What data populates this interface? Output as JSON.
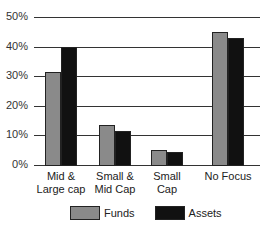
{
  "chart_data": {
    "type": "bar",
    "title": "",
    "xlabel": "",
    "ylabel": "",
    "ylim": [
      0,
      50
    ],
    "yticks": [
      "0%",
      "10%",
      "20%",
      "30%",
      "40%",
      "50%"
    ],
    "categories": [
      "Mid & Large cap",
      "Small & Mid Cap",
      "Small Cap",
      "No Focus"
    ],
    "series": [
      {
        "name": "Funds",
        "color": "#8a8a8a",
        "values": [
          31.5,
          13.5,
          5,
          45
        ]
      },
      {
        "name": "Assets",
        "color": "#111111",
        "values": [
          40,
          11.5,
          4.3,
          43
        ]
      }
    ],
    "grid": true,
    "legend_position": "bottom"
  },
  "labels": {
    "yticks": [
      "0%",
      "10%",
      "20%",
      "30%",
      "40%",
      "50%"
    ],
    "cats": [
      [
        "Mid &",
        "Large cap"
      ],
      [
        "Small &",
        "Mid Cap"
      ],
      [
        "Small",
        "Cap"
      ],
      [
        "No Focus",
        ""
      ]
    ],
    "legend": [
      "Funds",
      "Assets"
    ]
  }
}
